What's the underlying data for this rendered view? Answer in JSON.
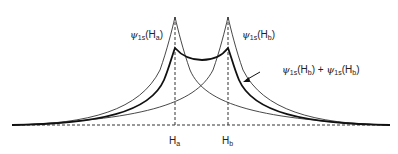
{
  "diagram": {
    "nuclei": [
      {
        "label": "H",
        "sub": "a",
        "x": 175
      },
      {
        "label": "H",
        "sub": "b",
        "x": 228
      }
    ],
    "curves": [
      {
        "name": "psi_1s(Ha)",
        "psi": "ψ",
        "orbital": "1s",
        "atom": "H",
        "atom_sub": "a"
      },
      {
        "name": "psi_1s(Hb)",
        "psi": "ψ",
        "orbital": "1s",
        "atom": "H",
        "atom_sub": "b"
      },
      {
        "name": "sum",
        "term1": {
          "psi": "ψ",
          "orbital": "1s",
          "atom": "H",
          "atom_sub": "b"
        },
        "plus": "+",
        "term2": {
          "psi": "ψ",
          "orbital": "1s",
          "atom": "H",
          "atom_sub": "b"
        }
      }
    ],
    "colors": {
      "line": "#222222",
      "background": "#ffffff"
    }
  }
}
